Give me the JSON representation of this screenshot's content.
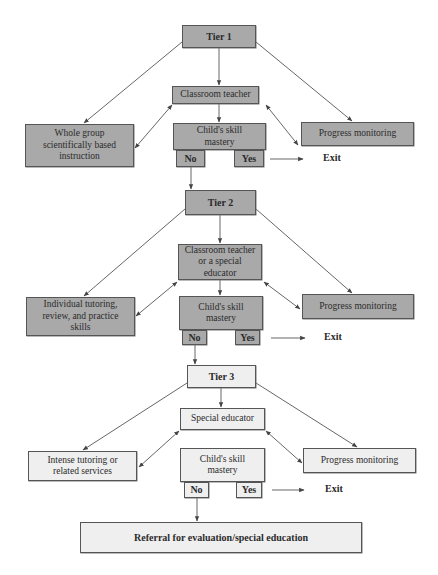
{
  "diagram": {
    "colors": {
      "tier_fill_dark": "#a9a9a9",
      "tier_fill_light": "#efefef",
      "border": "#555555",
      "arrow": "#444444"
    },
    "tiers": [
      {
        "title": "Tier 1",
        "provider": "Classroom teacher",
        "intervention": "Whole group scientifically based instruction",
        "monitoring": "Progress monitoring",
        "decision": "Child's skill mastery",
        "no_label": "No",
        "yes_label": "Yes",
        "yes_outcome": "Exit"
      },
      {
        "title": "Tier 2",
        "provider": "Classroom teacher or a special educator",
        "intervention": "Individual tutoring, review, and practice skills",
        "monitoring": "Progress monitoring",
        "decision": "Child's skill mastery",
        "no_label": "No",
        "yes_label": "Yes",
        "yes_outcome": "Exit"
      },
      {
        "title": "Tier 3",
        "provider": "Special educator",
        "intervention": "Intense tutoring or related services",
        "monitoring": "Progress monitoring",
        "decision": "Child's skill mastery",
        "no_label": "No",
        "yes_label": "Yes",
        "yes_outcome": "Exit"
      }
    ],
    "final_outcome": "Referral for evaluation/special education"
  }
}
